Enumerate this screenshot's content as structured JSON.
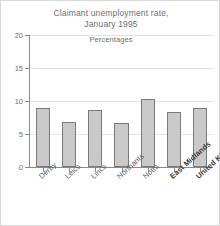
{
  "chart_data": {
    "type": "bar",
    "title": "Claimant unemployment rate, January 1995",
    "title_lines": [
      "Claimant unemployment rate,",
      "January 1995"
    ],
    "subtitle": "Percentages",
    "xlabel": "",
    "ylabel": "",
    "ylim": [
      0,
      20
    ],
    "yticks": [
      0,
      5,
      10,
      15,
      20
    ],
    "ytick_labels": [
      "0",
      "5",
      "10",
      "15",
      "20"
    ],
    "grid": true,
    "legend": "none",
    "categories": [
      "Derby",
      "Leics",
      "Lincs",
      "Northants",
      "Notts",
      "East Midlands",
      "United Kingdom"
    ],
    "values": [
      9.0,
      6.8,
      8.6,
      6.6,
      10.3,
      8.4,
      8.9
    ],
    "emphasis": [
      false,
      false,
      false,
      false,
      false,
      true,
      true
    ],
    "bar_fill": "#c9c9c9",
    "bar_stroke": "#7a7a7a",
    "axis_color": "#8a8a8a",
    "grid_color": "#e2e2e2",
    "text_color": "#6e6e6e",
    "background": "#ffffff",
    "frame_color": "#d8d8d8"
  }
}
